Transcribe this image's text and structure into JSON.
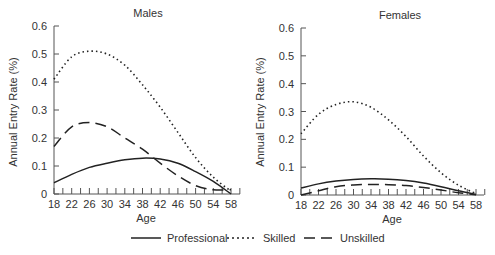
{
  "chart_data": [
    {
      "type": "line",
      "title": "Males",
      "xlabel": "Age",
      "ylabel": "Annual Entry Rate (%)",
      "xlim": [
        18,
        60
      ],
      "ylim": [
        0,
        0.6
      ],
      "xticks": [
        18,
        22,
        26,
        30,
        34,
        38,
        42,
        46,
        50,
        54,
        58
      ],
      "yticks": [
        0,
        0.1,
        0.2,
        0.3,
        0.4,
        0.5,
        0.6
      ],
      "grid": false,
      "x": [
        18,
        22,
        26,
        30,
        34,
        38,
        42,
        46,
        50,
        54,
        58
      ],
      "series": [
        {
          "name": "Professional",
          "style": "solid",
          "values": [
            0.04,
            0.07,
            0.095,
            0.11,
            0.122,
            0.128,
            0.125,
            0.11,
            0.08,
            0.045,
            0.0
          ]
        },
        {
          "name": "Skilled",
          "style": "dotted",
          "values": [
            0.41,
            0.49,
            0.51,
            0.5,
            0.46,
            0.39,
            0.31,
            0.22,
            0.13,
            0.06,
            0.01
          ]
        },
        {
          "name": "Unskilled",
          "style": "dashed",
          "values": [
            0.17,
            0.24,
            0.255,
            0.24,
            0.2,
            0.16,
            0.11,
            0.065,
            0.03,
            0.015,
            0.015
          ]
        }
      ]
    },
    {
      "type": "line",
      "title": "Females",
      "xlabel": "Age",
      "ylabel": "Annual Entry Rate (%)",
      "xlim": [
        18,
        60
      ],
      "ylim": [
        0,
        0.6
      ],
      "xticks": [
        18,
        22,
        26,
        30,
        34,
        38,
        42,
        46,
        50,
        54,
        58
      ],
      "yticks": [
        0,
        0.1,
        0.2,
        0.3,
        0.4,
        0.5,
        0.6
      ],
      "grid": false,
      "x": [
        18,
        22,
        26,
        30,
        34,
        38,
        42,
        46,
        50,
        54,
        58
      ],
      "series": [
        {
          "name": "Professional",
          "style": "solid",
          "values": [
            0.025,
            0.04,
            0.05,
            0.056,
            0.058,
            0.057,
            0.052,
            0.043,
            0.03,
            0.015,
            0.002
          ]
        },
        {
          "name": "Skilled",
          "style": "dotted",
          "values": [
            0.22,
            0.29,
            0.325,
            0.335,
            0.315,
            0.27,
            0.21,
            0.14,
            0.08,
            0.035,
            0.005
          ]
        },
        {
          "name": "Unskilled",
          "style": "dashed",
          "values": [
            0.0,
            0.015,
            0.03,
            0.036,
            0.038,
            0.037,
            0.034,
            0.027,
            0.018,
            0.008,
            0.001
          ]
        }
      ]
    }
  ],
  "legend": {
    "items": [
      {
        "label": "Professional",
        "style": "solid"
      },
      {
        "label": "Skilled",
        "style": "dotted"
      },
      {
        "label": "Unskilled",
        "style": "dashed"
      }
    ]
  },
  "panels": {
    "left": {
      "title": "Males",
      "xlabel": "Age",
      "ylabel": "Annual Entry Rate (%)"
    },
    "right": {
      "title": "Females",
      "xlabel": "Age",
      "ylabel": "Annual Entry Rate (%)"
    }
  }
}
